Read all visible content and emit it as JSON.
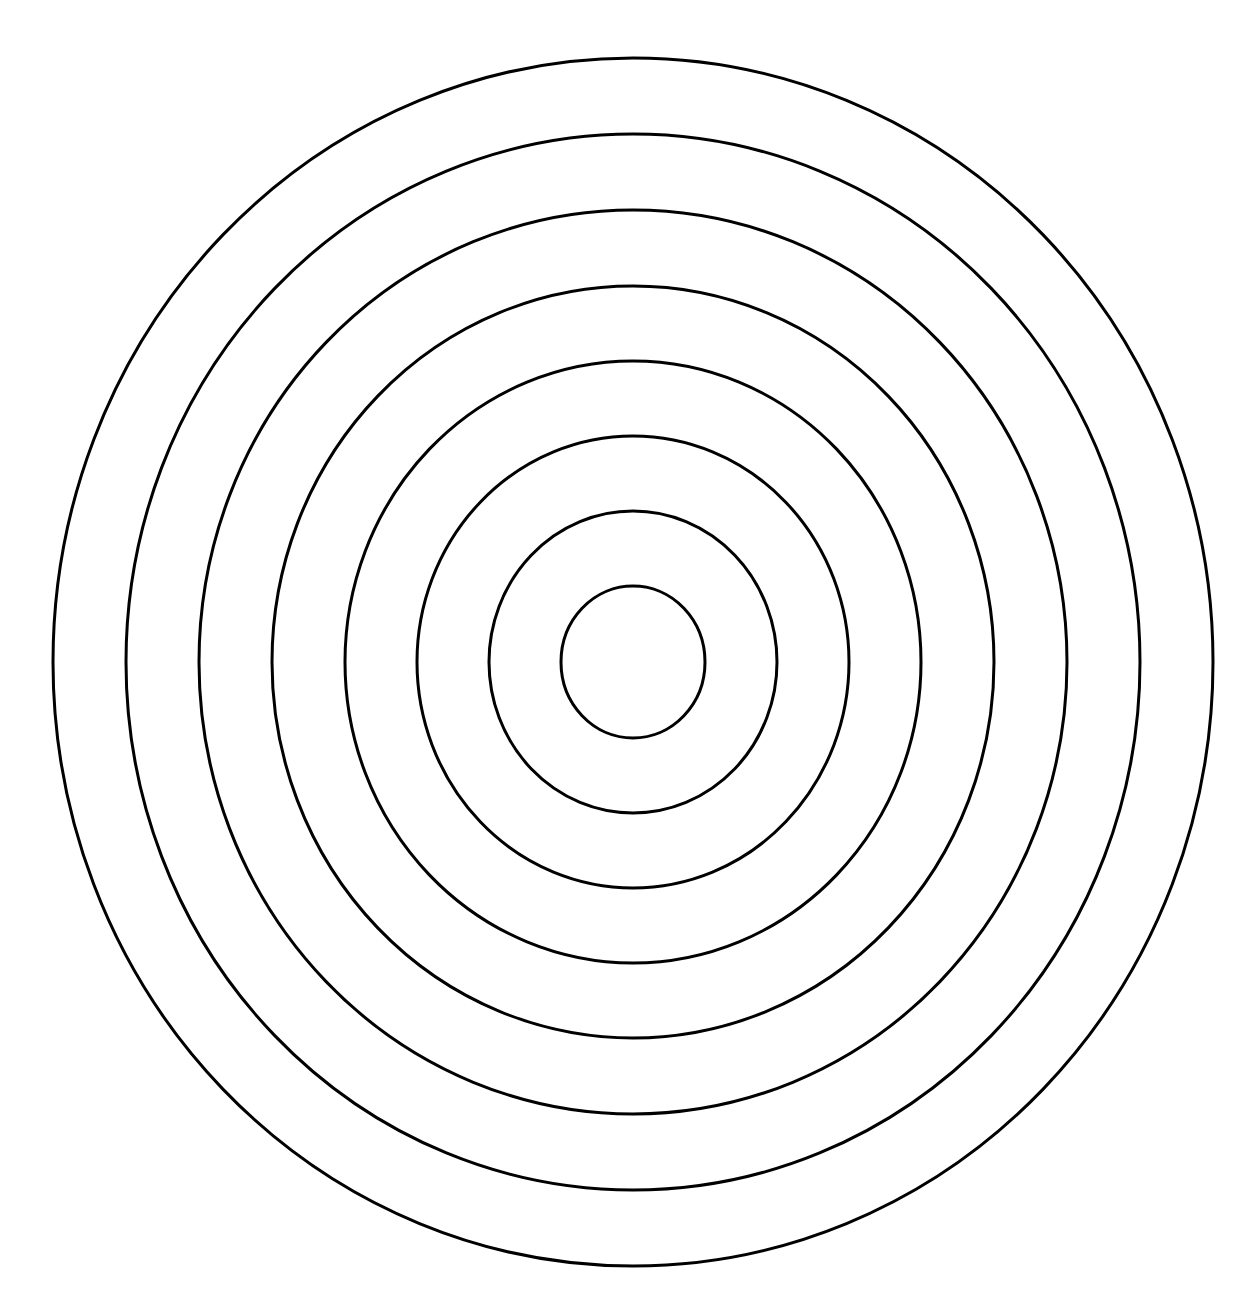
{
  "diagram": {
    "type": "concentric-rings",
    "ring_count": 8,
    "stroke_color": "#000000",
    "background_color": "#ffffff",
    "stroke_width": 3,
    "center": {
      "x": 633,
      "y": 662
    },
    "rings": [
      {
        "rx": 580,
        "ry": 604
      },
      {
        "rx": 507,
        "ry": 528
      },
      {
        "rx": 434,
        "ry": 452
      },
      {
        "rx": 361,
        "ry": 376
      },
      {
        "rx": 288,
        "ry": 301
      },
      {
        "rx": 216,
        "ry": 226
      },
      {
        "rx": 144,
        "ry": 151
      },
      {
        "rx": 72,
        "ry": 76
      }
    ]
  }
}
